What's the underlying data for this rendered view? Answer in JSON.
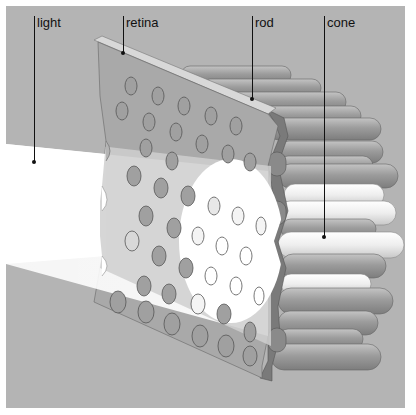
{
  "diagram": {
    "labels": [
      {
        "id": "light",
        "text": "light"
      },
      {
        "id": "retina",
        "text": "retina"
      },
      {
        "id": "rod",
        "text": "rod"
      },
      {
        "id": "cone",
        "text": "cone"
      }
    ],
    "colors": {
      "background": "#b4b4b4",
      "retina_face": "#a6a6a6",
      "retina_edge": "#7a7a7a",
      "light_beam": "#ffffff",
      "rod": "#9a9a9a",
      "cone": "#f2f2f2",
      "leader": "#111111"
    }
  }
}
